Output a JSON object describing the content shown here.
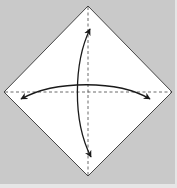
{
  "diagram": {
    "type": "origami-fold-diagram",
    "colors": {
      "background": "#c9c9c9",
      "background_edge": "#e6e6e6",
      "paper": "#ffffff",
      "paper_edge": "#333333",
      "fold_line": "#444444",
      "arrow": "#1a1a1a"
    },
    "paper": {
      "shape": "diamond",
      "vertices": {
        "top": [
          88,
          6
        ],
        "right": [
          172,
          92
        ],
        "bottom": [
          88,
          176
        ],
        "left": [
          4,
          92
        ]
      }
    },
    "fold_lines": [
      {
        "name": "vertical-diagonal",
        "style": "dashed",
        "from": [
          88,
          6
        ],
        "to": [
          88,
          176
        ]
      },
      {
        "name": "horizontal-diagonal",
        "style": "dashed",
        "from": [
          4,
          92
        ],
        "to": [
          172,
          92
        ]
      }
    ],
    "arrows": [
      {
        "name": "vertical-fold-unfold-arrow",
        "style": "double-headed-arc",
        "from": [
          90,
          28
        ],
        "to": [
          91,
          158
        ]
      },
      {
        "name": "horizontal-fold-unfold-arrow",
        "style": "double-headed-arc",
        "from": [
          20,
          100
        ],
        "to": [
          151,
          100
        ]
      }
    ]
  }
}
